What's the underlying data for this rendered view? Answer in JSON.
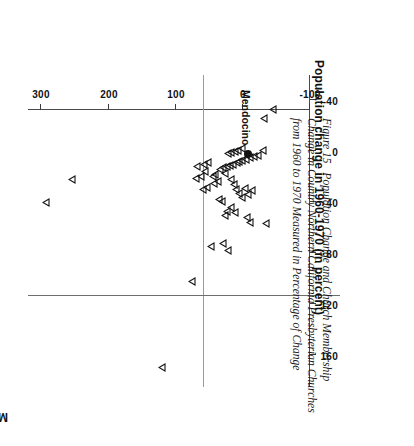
{
  "figure": {
    "number_label": "Figure 15",
    "caption": "Population Change and Church Membership Change in Country Northern California Presbyterian Churches from 1960 to 1970 Measured in Percentage of Change"
  },
  "chart_data": {
    "type": "scatter",
    "title": "",
    "orientation_note": "plot printed rotated 180 degrees; caption and x-axis title rotated 90 degrees",
    "xlabel": "Population change in 1960-1970 (in percent)",
    "ylabel": "Membership change in 1960-1970 (in percent)",
    "xlim": [
      -60,
      185
    ],
    "ylim": [
      -100,
      320
    ],
    "xticks": [
      -40,
      0,
      40,
      80,
      120,
      160
    ],
    "xticklabels": [
      "-40",
      "0",
      "40",
      "80",
      "120",
      "160"
    ],
    "yticks": [
      -100,
      0,
      100,
      200,
      300
    ],
    "yticklabels": [
      "-100",
      "0",
      "100",
      "200",
      "300"
    ],
    "grid": false,
    "legend": null,
    "zero_lines": {
      "x": 0,
      "y": 0
    },
    "marker_styles": {
      "church": "open-right-triangle",
      "highlight": "filled-circle"
    },
    "annotations": [
      {
        "text": "Mendocino",
        "x": 2,
        "y": -8,
        "rotation": 90
      }
    ],
    "points": [
      {
        "x": 40,
        "y": 293,
        "marker": "open-right-triangle"
      },
      {
        "x": 22,
        "y": 255,
        "marker": "open-right-triangle"
      },
      {
        "x": 170,
        "y": 120,
        "marker": "open-right-triangle"
      },
      {
        "x": 102,
        "y": 76,
        "marker": "open-right-triangle"
      },
      {
        "x": 75,
        "y": 48,
        "marker": "open-right-triangle"
      },
      {
        "x": 72,
        "y": 30,
        "marker": "open-right-triangle"
      },
      {
        "x": 78,
        "y": 22,
        "marker": "open-right-triangle"
      },
      {
        "x": 38,
        "y": 36,
        "marker": "open-right-triangle"
      },
      {
        "x": 39,
        "y": 31,
        "marker": "open-right-triangle"
      },
      {
        "x": 30,
        "y": 60,
        "marker": "open-right-triangle"
      },
      {
        "x": 28,
        "y": 54,
        "marker": "open-right-triangle"
      },
      {
        "x": 25,
        "y": 43,
        "marker": "open-right-triangle"
      },
      {
        "x": 24,
        "y": 37,
        "marker": "open-right-triangle"
      },
      {
        "x": 20,
        "y": 45,
        "marker": "open-right-triangle"
      },
      {
        "x": 18,
        "y": 41,
        "marker": "open-right-triangle"
      },
      {
        "x": 17,
        "y": 26,
        "marker": "open-right-triangle"
      },
      {
        "x": 22,
        "y": 17,
        "marker": "open-right-triangle"
      },
      {
        "x": 26,
        "y": 13,
        "marker": "open-right-triangle"
      },
      {
        "x": 30,
        "y": 10,
        "marker": "open-right-triangle"
      },
      {
        "x": 33,
        "y": 5,
        "marker": "open-right-triangle"
      },
      {
        "x": 36,
        "y": 2,
        "marker": "open-right-triangle"
      },
      {
        "x": 29,
        "y": -3,
        "marker": "open-right-triangle"
      },
      {
        "x": 34,
        "y": -8,
        "marker": "open-right-triangle"
      },
      {
        "x": 31,
        "y": -14,
        "marker": "open-right-triangle"
      },
      {
        "x": 14,
        "y": 34,
        "marker": "open-right-triangle"
      },
      {
        "x": 13,
        "y": 29,
        "marker": "open-right-triangle"
      },
      {
        "x": 12,
        "y": 24,
        "marker": "open-right-triangle"
      },
      {
        "x": 11,
        "y": 19,
        "marker": "open-right-triangle"
      },
      {
        "x": 10,
        "y": 14,
        "marker": "open-right-triangle"
      },
      {
        "x": 9,
        "y": 9,
        "marker": "open-right-triangle"
      },
      {
        "x": 8,
        "y": 5,
        "marker": "open-right-triangle"
      },
      {
        "x": 7,
        "y": 1,
        "marker": "open-right-triangle"
      },
      {
        "x": 6,
        "y": -5,
        "marker": "open-right-triangle"
      },
      {
        "x": 5,
        "y": -11,
        "marker": "open-right-triangle"
      },
      {
        "x": 4,
        "y": -17,
        "marker": "open-right-triangle"
      },
      {
        "x": 3,
        "y": -23,
        "marker": "open-right-triangle"
      },
      {
        "x": 2,
        "y": 22,
        "marker": "open-right-triangle"
      },
      {
        "x": 1,
        "y": 17,
        "marker": "open-right-triangle"
      },
      {
        "x": 0,
        "y": 12,
        "marker": "open-right-triangle"
      },
      {
        "x": -1,
        "y": 7,
        "marker": "open-right-triangle"
      },
      {
        "x": -2,
        "y": 2,
        "marker": "open-right-triangle"
      },
      {
        "x": 16,
        "y": 56,
        "marker": "open-right-triangle"
      },
      {
        "x": 20,
        "y": 62,
        "marker": "open-right-triangle"
      },
      {
        "x": 21,
        "y": 70,
        "marker": "open-right-triangle"
      },
      {
        "x": 12,
        "y": 68,
        "marker": "open-right-triangle"
      },
      {
        "x": 10,
        "y": 58,
        "marker": "open-right-triangle"
      },
      {
        "x": 9,
        "y": 52,
        "marker": "open-right-triangle"
      },
      {
        "x": 47,
        "y": 23,
        "marker": "open-right-triangle"
      },
      {
        "x": 50,
        "y": 26,
        "marker": "open-right-triangle"
      },
      {
        "x": 44,
        "y": 17,
        "marker": "open-right-triangle"
      },
      {
        "x": 48,
        "y": 12,
        "marker": "open-right-triangle"
      },
      {
        "x": 52,
        "y": -6,
        "marker": "open-right-triangle"
      },
      {
        "x": 56,
        "y": -10,
        "marker": "open-right-triangle"
      },
      {
        "x": 57,
        "y": -35,
        "marker": "open-right-triangle"
      },
      {
        "x": -26,
        "y": -32,
        "marker": "open-right-triangle"
      },
      {
        "x": -33,
        "y": -45,
        "marker": "open-right-triangle"
      },
      {
        "x": -1,
        "y": -30,
        "marker": "open-right-triangle"
      },
      {
        "x": 2,
        "y": -8,
        "marker": "filled-circle",
        "label": "Mendocino"
      }
    ]
  }
}
